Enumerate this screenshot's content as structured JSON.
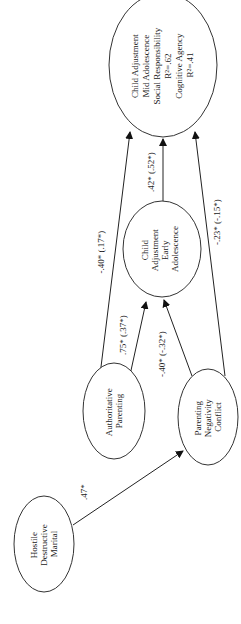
{
  "nodes": {
    "hostile": {
      "lines": [
        "Hostile",
        "Destructive",
        "Marital"
      ]
    },
    "authoritative": {
      "lines": [
        "Authoritative",
        "Parenting"
      ]
    },
    "negativity": {
      "lines": [
        "Parenting",
        "Negativity",
        "Conflict"
      ]
    },
    "early": {
      "lines": [
        "Child",
        "Adjustment",
        "Early",
        "Adolescence"
      ]
    },
    "mid": {
      "lines": [
        "Child Adjustment",
        "Mid Adolescence",
        "Social Responsibility",
        "R²=.62",
        "Cognitive Agency",
        "R²=.41"
      ]
    }
  },
  "paths": {
    "hostile_to_negativity": ".47*",
    "authoritative_to_early": ".75* (.37*)",
    "negativity_to_early": "-.40* (-.32*)",
    "authoritative_to_mid": "-.40* (.17*)",
    "early_to_mid": ".42* (.52*)",
    "negativity_to_mid": "-.23* (-.15*)"
  }
}
